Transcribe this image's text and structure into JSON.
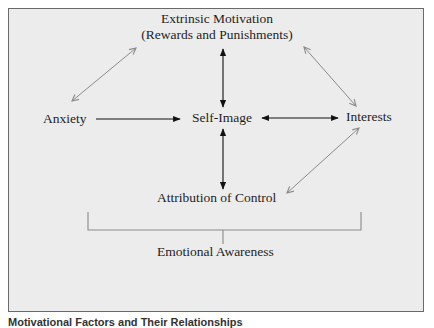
{
  "diagram": {
    "nodes": {
      "extrinsic_motivation": {
        "line1": "Extrinsic Motivation",
        "line2": "(Rewards and Punishments)"
      },
      "anxiety": {
        "label": "Anxiety"
      },
      "self_image": {
        "label": "Self-Image"
      },
      "interests": {
        "label": "Interests"
      },
      "attribution_of_control": {
        "label": "Attribution of Control"
      },
      "emotional_awareness": {
        "label": "Emotional Awareness"
      }
    },
    "edges": [
      {
        "from": "anxiety",
        "to": "self_image",
        "direction": "one-way",
        "color": "#111111"
      },
      {
        "from": "self_image",
        "to": "interests",
        "direction": "two-way",
        "color": "#111111"
      },
      {
        "from": "self_image",
        "to": "extrinsic_motivation",
        "direction": "two-way",
        "color": "#111111"
      },
      {
        "from": "self_image",
        "to": "attribution_of_control",
        "direction": "two-way",
        "color": "#111111"
      },
      {
        "from": "anxiety",
        "to": "extrinsic_motivation",
        "direction": "two-way",
        "color": "#8a8a8a"
      },
      {
        "from": "extrinsic_motivation",
        "to": "interests",
        "direction": "two-way",
        "color": "#8a8a8a"
      },
      {
        "from": "interests",
        "to": "attribution_of_control",
        "direction": "two-way",
        "color": "#8a8a8a"
      }
    ],
    "bracket": {
      "groups": "all factors",
      "label_ref": "emotional_awareness",
      "color": "#8a8a8a"
    }
  },
  "caption": {
    "text": "Motivational Factors and Their Relationships"
  },
  "colors": {
    "panel_background": "#ececec",
    "panel_border": "#6a6a6a",
    "primary_arrow": "#111111",
    "secondary_arrow": "#8a8a8a",
    "text": "#1e1e1e"
  }
}
